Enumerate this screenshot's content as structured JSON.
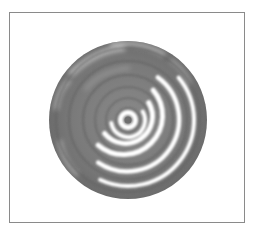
{
  "figure": {
    "frame": {
      "x": 9,
      "y": 12,
      "width": 236,
      "height": 211,
      "stroke": "#8a8a8a"
    },
    "disk": {
      "center": [
        128,
        120
      ],
      "radius": 79,
      "base_color": "#7e7e7e",
      "dark_color": "#6a6a6a",
      "light_color": "#b5b5b5",
      "center_dot": {
        "radius": 3.5,
        "color": "#6e6e6e"
      },
      "white_arcs": [
        {
          "r": 7.5,
          "w": 5,
          "start": 0,
          "end": 360
        },
        {
          "r": 17,
          "w": 4,
          "start": -30,
          "end": 200
        },
        {
          "r": 27,
          "w": 5,
          "start": -40,
          "end": 150
        },
        {
          "r": 39,
          "w": 5,
          "start": -50,
          "end": 140
        },
        {
          "r": 52,
          "w": 4.5,
          "start": -55,
          "end": 125
        },
        {
          "r": 66,
          "w": 4,
          "start": -40,
          "end": 115
        }
      ]
    }
  }
}
